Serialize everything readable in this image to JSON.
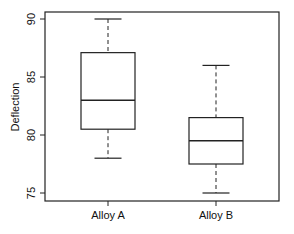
{
  "chart_data": {
    "type": "boxplot",
    "title": "",
    "xlabel": "",
    "ylabel": "Deflection",
    "categories": [
      "Alloy A",
      "Alloy B"
    ],
    "series": [
      {
        "name": "Alloy A",
        "whisker_low": 78.0,
        "q1": 80.5,
        "median": 83.0,
        "q3": 87.1,
        "whisker_high": 90.0
      },
      {
        "name": "Alloy B",
        "whisker_low": 75.0,
        "q1": 77.5,
        "median": 79.5,
        "q3": 81.5,
        "whisker_high": 86.0
      }
    ],
    "yticks": [
      75,
      80,
      85,
      90
    ],
    "ylim": [
      74.4,
      90.6
    ],
    "grid": false,
    "legend": null
  },
  "axis": {
    "y_label": "Deflection",
    "y_tick_labels": [
      "75",
      "80",
      "85",
      "90"
    ],
    "x_tick_labels": [
      "Alloy A",
      "Alloy B"
    ]
  },
  "colors": {
    "line": "#222222",
    "background": "#ffffff"
  }
}
